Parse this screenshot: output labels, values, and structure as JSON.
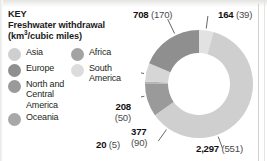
{
  "key": {
    "heading": "KEY",
    "subtitle_line1": "Freshwater withdrawal",
    "subtitle_line2_prefix": "(km",
    "subtitle_superscript": "3",
    "subtitle_line2_suffix": "/cubic miles)"
  },
  "legend": {
    "column1": [
      {
        "label": "Asia",
        "color": "#cfcfcf",
        "name": "asia"
      },
      {
        "label": "Europe",
        "color": "#8f8f8f",
        "name": "europe"
      },
      {
        "label": "North and\nCentral\nAmerica",
        "color": "#9a9a9a",
        "name": "north-and-central-america"
      },
      {
        "label": "Oceania",
        "color": "#a8a8a8",
        "name": "oceania"
      }
    ],
    "column2": [
      {
        "label": "Africa",
        "color": "#a3a3a3",
        "name": "africa"
      },
      {
        "label": "South\nAmerica",
        "color": "#dcdcdc",
        "name": "south-america"
      }
    ]
  },
  "callouts": {
    "europe": {
      "value": "708",
      "paren": "(170)"
    },
    "africa": {
      "value": "164",
      "paren": "(39)"
    },
    "asia": {
      "value": "2,297",
      "paren": "(551)"
    },
    "ncamerica": {
      "value": "377",
      "paren": "(90)"
    },
    "southamerica": {
      "value": "208",
      "paren": "(50)"
    },
    "oceania": {
      "value": "20",
      "paren": "(5)"
    }
  },
  "chart_data": {
    "type": "pie",
    "title": "Freshwater withdrawal (km3/cubic miles)",
    "subtype": "donut",
    "units_primary": "km3",
    "units_secondary": "cubic miles",
    "legend_position": "left",
    "grid": false,
    "xlabel": "",
    "ylabel": "",
    "total_km3": 3874,
    "categories": [
      "Africa",
      "Asia",
      "North and Central America",
      "Oceania",
      "South America",
      "Europe"
    ],
    "values": [
      164,
      2297,
      377,
      20,
      208,
      708
    ],
    "values_cubic_miles": [
      39,
      551,
      90,
      5,
      50,
      170
    ],
    "colors": [
      "#e2e2e2",
      "#cfcfcf",
      "#9a9a9a",
      "#b4b4b4",
      "#d6d6d6",
      "#8f8f8f"
    ],
    "labels": [
      "164 (39)",
      "2,297 (551)",
      "377 (90)",
      "20 (5)",
      "208 (50)",
      "708 (170)"
    ],
    "series": [
      {
        "name": "Freshwater withdrawal",
        "values": [
          164,
          2297,
          377,
          20,
          208,
          708
        ]
      }
    ]
  }
}
